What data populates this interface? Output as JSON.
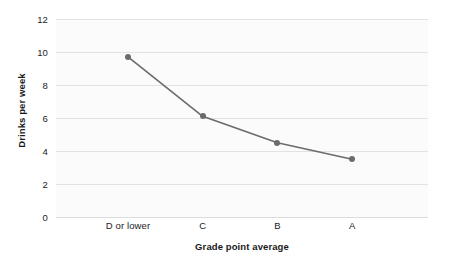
{
  "chart_data": {
    "type": "line",
    "title": "",
    "subtitle": "",
    "xlabel": "Grade point average",
    "ylabel": "Drinks per week",
    "categories": [
      "D or lower",
      "C",
      "B",
      "A"
    ],
    "values": [
      9.7,
      6.1,
      4.5,
      3.5
    ],
    "series": [
      {
        "name": "Drinks per week",
        "values": [
          9.7,
          6.1,
          4.5,
          3.5
        ]
      }
    ],
    "ylim": [
      0,
      12
    ],
    "yticks": [
      0,
      2,
      4,
      6,
      8,
      10,
      12
    ],
    "ytick_labels": [
      "0",
      "2",
      "4",
      "6",
      "8",
      "10",
      "12"
    ],
    "xtick_labels": [
      "D or lower",
      "C",
      "B",
      "A"
    ],
    "grid": "horizontal",
    "legend": "none",
    "annotations": [],
    "colors": {
      "line": "#6b6b6b",
      "marker": "#6b6b6b",
      "gridline": "#e2e2e2",
      "plot_background": "#fbfbfb",
      "figure_background": "#ffffff",
      "tick_label": "#222222",
      "axis_title": "#1a1a1a"
    }
  }
}
